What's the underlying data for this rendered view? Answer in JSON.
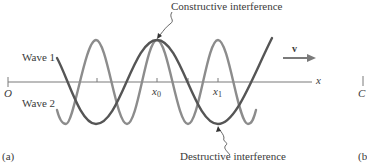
{
  "figure": {
    "panel_label": "(a)",
    "next_panel_label_fragment": "(b",
    "next_panel_origin_fragment": "C",
    "annotations": {
      "constructive": "Constructive interference",
      "destructive": "Destructive interference"
    },
    "waves": [
      {
        "name": "Wave 1",
        "label": "Wave 1",
        "color": "#555555",
        "wavelength_px": 122,
        "amplitude_px": 42,
        "peak_x": 157
      },
      {
        "name": "Wave 2",
        "label": "Wave 2",
        "color": "#8c8c8c",
        "wavelength_px": 61,
        "amplitude_px": 42,
        "peak_x": 157
      }
    ],
    "axis": {
      "label": "x",
      "origin_label": "O",
      "ticks": [
        {
          "label": "x",
          "sub": "0"
        },
        {
          "label": "x",
          "sub": "1"
        }
      ]
    },
    "velocity": {
      "label": "v",
      "direction": "right"
    },
    "colors": {
      "axis": "#7a7a7a",
      "text": "#3a3a3a",
      "arrow": "#7a7a7a"
    }
  }
}
